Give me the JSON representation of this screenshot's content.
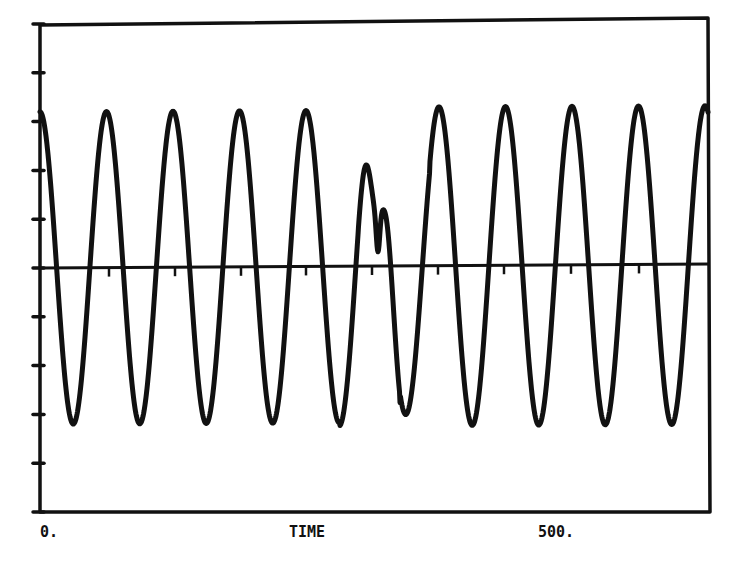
{
  "chart_data": {
    "type": "line",
    "title": "",
    "xlabel": "TIME",
    "ylabel": "",
    "x_tick_labels": [
      "0.",
      "500."
    ],
    "xlim": [
      0,
      670
    ],
    "ylim": [
      -5,
      5
    ],
    "y_ticks": [
      -5,
      -4,
      -3,
      -2,
      -1,
      0,
      1,
      2,
      3,
      4,
      5
    ],
    "y_tick_labels": [],
    "grid": false,
    "legend": null,
    "zero_line": true,
    "period_markers_x": [
      69,
      135,
      201,
      266,
      332,
      398,
      464,
      531,
      599
    ],
    "series": [
      {
        "name": "signal",
        "description": "Sinusoid, period ~66.5 time units, amplitude ~3.2 divisions, with a disturbed double-peak near t=340",
        "x": [
          0,
          18,
          36,
          52,
          70,
          86,
          103,
          119,
          136,
          153,
          170,
          186,
          203,
          220,
          237,
          253,
          270,
          287,
          304,
          320,
          331,
          338,
          344,
          358,
          374,
          391,
          409,
          426,
          444,
          461,
          478,
          495,
          512,
          529,
          546,
          563,
          580,
          597,
          615,
          631,
          648,
          660,
          668
        ],
        "y": [
          3.1,
          0.3,
          -3.2,
          0.0,
          3.2,
          0.0,
          -3.2,
          0.0,
          3.2,
          0.0,
          -3.2,
          0.0,
          3.2,
          0.0,
          -3.2,
          0.0,
          3.15,
          0.0,
          -3.15,
          0.0,
          1.0,
          0.3,
          1.1,
          0.0,
          -2.95,
          0.0,
          3.15,
          0.0,
          -3.2,
          0.0,
          3.25,
          0.0,
          -3.2,
          0.0,
          3.25,
          0.0,
          -3.2,
          0.0,
          3.3,
          0.0,
          -3.2,
          -1.5,
          -0.6
        ]
      }
    ]
  },
  "labels": {
    "x_start": "0.",
    "x_mid": "TIME",
    "x_500": "500."
  },
  "style": {
    "ink": "#111111",
    "background": "#ffffff"
  }
}
